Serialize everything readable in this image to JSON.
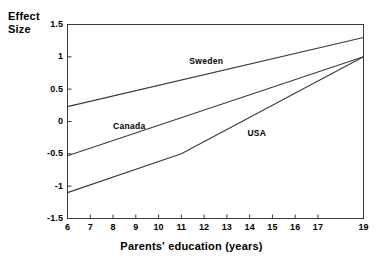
{
  "chart_data": {
    "type": "line",
    "title": "",
    "xlabel": "Parents' education (years)",
    "ylabel": "Effect Size",
    "ylabel_lines": [
      "Effect",
      "Size"
    ],
    "xlim": [
      6,
      19
    ],
    "ylim": [
      -1.5,
      1.5
    ],
    "grid": false,
    "legend_position": "inline-annotations",
    "frame": "box",
    "x_ticks": [
      6,
      7,
      8,
      9,
      10,
      11,
      12,
      13,
      14,
      15,
      16,
      17,
      19
    ],
    "x_tick_labels": [
      "6",
      "7",
      "8",
      "9",
      "10",
      "11",
      "12",
      "13",
      "14",
      "15",
      "16",
      "17",
      "19"
    ],
    "y_ticks": [
      1.5,
      1,
      0.5,
      0,
      -0.5,
      -1,
      -1.5
    ],
    "y_tick_labels": [
      "1.5",
      "1",
      "0.5",
      "0",
      "-0.5",
      "-1",
      "-1.5"
    ],
    "line_color": "#3a3a3a",
    "series": [
      {
        "name": "Sweden",
        "label": "Sweden",
        "label_x": 11.35,
        "label_y": 0.93,
        "x": [
          6,
          19
        ],
        "values": [
          0.23,
          1.3
        ]
      },
      {
        "name": "Canada",
        "label": "Canada",
        "label_x": 8.0,
        "label_y": -0.07,
        "x": [
          6,
          19
        ],
        "values": [
          -0.53,
          1.0
        ]
      },
      {
        "name": "USA",
        "label": "USA",
        "label_x": 13.9,
        "label_y": -0.18,
        "x": [
          6,
          11,
          19
        ],
        "values": [
          -1.1,
          -0.5,
          1.0
        ]
      }
    ]
  }
}
